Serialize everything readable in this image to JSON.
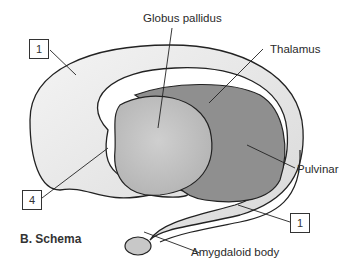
{
  "figure": {
    "title": "B. Schema",
    "labels": {
      "globus_pallidus": "Globus pallidus",
      "thalamus": "Thalamus",
      "pulvinar": "Pulvinar",
      "amygdaloid_body": "Amygdaloid body"
    },
    "numbered_boxes": {
      "top_left": "1",
      "left": "4",
      "bottom_right": "1"
    },
    "colors": {
      "caudate": "#e8e8e8",
      "globus_pallidus": "#c4c4c4",
      "thalamus": "#8f8f8f",
      "outline": "#222222"
    }
  }
}
